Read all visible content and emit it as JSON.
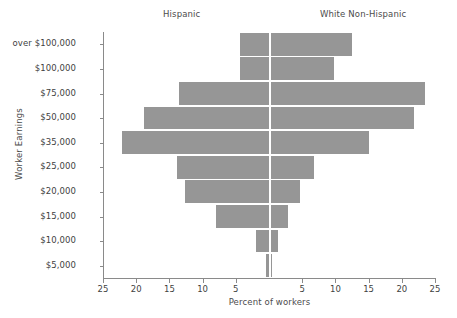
{
  "headers": {
    "left_group": "Hispanic",
    "right_group": "White Non-Hispanic"
  },
  "axes": {
    "y_title": "Worker Earnings",
    "x_title": "Percent of workers"
  },
  "style": {
    "bar_color": "#969696",
    "axis_color": "#8a8a8a",
    "center_line_color": "#ffffff",
    "text_color": "#4a4a4a",
    "background": "#ffffff"
  },
  "chart_data": {
    "type": "bar",
    "title": "",
    "subtitle": "",
    "orientation": "horizontal",
    "layout": "population-pyramid",
    "xlabel": "Percent of workers",
    "ylabel": "Worker Earnings",
    "grid": false,
    "legend_position": "top",
    "xlim": [
      -25,
      25
    ],
    "x_tick_labels": [
      "25",
      "20",
      "15",
      "10",
      "5",
      "5",
      "10",
      "15",
      "20",
      "25"
    ],
    "x_tick_values": [
      -25,
      -20,
      -15,
      -10,
      -5,
      5,
      10,
      15,
      20,
      25
    ],
    "categories": [
      "over $100,000",
      "$100,000",
      "$75,000",
      "$50,000",
      "$35,000",
      "$25,000",
      "$20,000",
      "$15,000",
      "$10,000",
      "$5,000"
    ],
    "series": [
      {
        "name": "Hispanic",
        "side": "left",
        "values": [
          4.4,
          4.4,
          13.6,
          18.8,
          22.1,
          13.8,
          12.7,
          8.0,
          2.0,
          0.45
        ]
      },
      {
        "name": "White Non-Hispanic",
        "side": "right",
        "values": [
          12.5,
          9.8,
          23.5,
          21.8,
          15.0,
          6.8,
          4.7,
          2.9,
          1.4,
          0.45
        ]
      }
    ]
  }
}
